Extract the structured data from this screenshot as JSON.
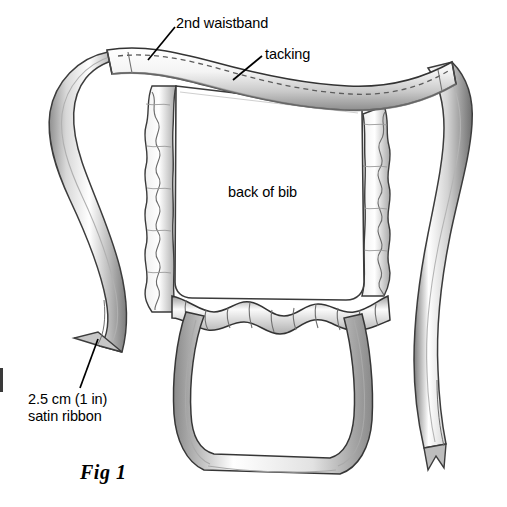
{
  "figure": {
    "caption": "Fig 1",
    "medium": "pencil line illustration",
    "background_color": "#ffffff",
    "ink_color": "#2b2b2b",
    "shade_color": "#9a9a9a"
  },
  "labels": {
    "waistband": "2nd waistband",
    "tacking": "tacking",
    "bib": "back of bib",
    "ribbon": "2.5 cm (1 in)\nsatin ribbon"
  },
  "annotations": {
    "leader_lines": [
      {
        "name": "waistband-leader",
        "from_x": 148,
        "from_y": 60,
        "to_x": 175,
        "to_y": 27
      },
      {
        "name": "tacking-leader",
        "from_x": 233,
        "from_y": 80,
        "to_x": 262,
        "to_y": 56
      },
      {
        "name": "ribbon-leader",
        "from_x": 96,
        "from_y": 341,
        "to_x": 80,
        "to_y": 386
      }
    ]
  },
  "measurements": {
    "ribbon_width_metric": "2.5 cm",
    "ribbon_width_imperial": "1 in"
  },
  "parts": [
    {
      "name": "2nd waistband",
      "description": "curved band across the top with dashed tacking stitch line"
    },
    {
      "name": "tacking",
      "description": "dashed stitching along the waistband"
    },
    {
      "name": "back of bib",
      "description": "large rectangular panel in the centre"
    },
    {
      "name": "ruffle",
      "description": "gathered frill along left and right edges and lower edge of bib"
    },
    {
      "name": "satin ribbon",
      "description": "2.5 cm (1 in) ties extending from each waistband end"
    }
  ],
  "canvas": {
    "width": 507,
    "height": 507
  }
}
